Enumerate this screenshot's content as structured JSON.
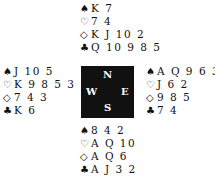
{
  "icons": {
    "spade": "♠",
    "heart": "♡",
    "diamond": "◇",
    "club": "♣"
  },
  "compass": {
    "north": "N",
    "south": "S",
    "west": "W",
    "east": "E"
  },
  "hands": {
    "north": {
      "spades": "K 7",
      "hearts": "7 4",
      "diamonds": "K J 10 2",
      "clubs": "Q 10 9 8 5"
    },
    "west": {
      "spades": "J 10 5",
      "hearts": "K 9 8 5 3",
      "diamonds": "7 4 3",
      "clubs": "K 6"
    },
    "east": {
      "spades": "A Q 9 6 3",
      "hearts": "J 6 2",
      "diamonds": "9 8 5",
      "clubs": "7 4"
    },
    "south": {
      "spades": "8 4 2",
      "hearts": "A Q 10",
      "diamonds": "A Q 6",
      "clubs": "A J 3 2"
    }
  }
}
